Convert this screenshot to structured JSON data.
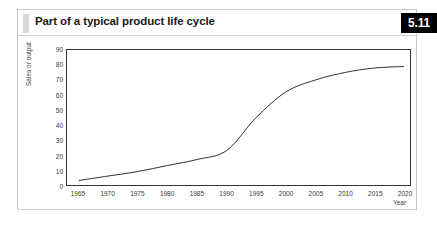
{
  "figure": {
    "title": "Part of a typical product life cycle",
    "badge": "5.11",
    "accent_color": "#d9d9d9",
    "badge_bg": "#000000",
    "badge_text_color": "#ffffff",
    "frame_color": "#c9c9c9",
    "plot_border_color": "#333333",
    "curve_color": "#1a1a1a"
  },
  "chart_data": {
    "type": "line",
    "title": "Part of a typical product life cycle",
    "subtitle": "",
    "xlabel": "Year",
    "ylabel": "Sales or output",
    "xlim": [
      1963,
      2021
    ],
    "ylim": [
      0,
      90
    ],
    "grid": false,
    "legend": false,
    "x_ticks": [
      1965,
      1970,
      1975,
      1980,
      1985,
      1990,
      1995,
      2000,
      2005,
      2010,
      2015,
      2020
    ],
    "y_ticks": [
      0,
      10,
      20,
      30,
      40,
      50,
      60,
      70,
      80,
      90
    ],
    "series": [
      {
        "name": "Sales or output",
        "x": [
          1965,
          1970,
          1975,
          1980,
          1985,
          1990,
          1995,
          2000,
          2005,
          2010,
          2015,
          2020
        ],
        "values": [
          3,
          6,
          9,
          13,
          17,
          23,
          45,
          62,
          70,
          75,
          78,
          79
        ]
      }
    ],
    "annotations": []
  }
}
